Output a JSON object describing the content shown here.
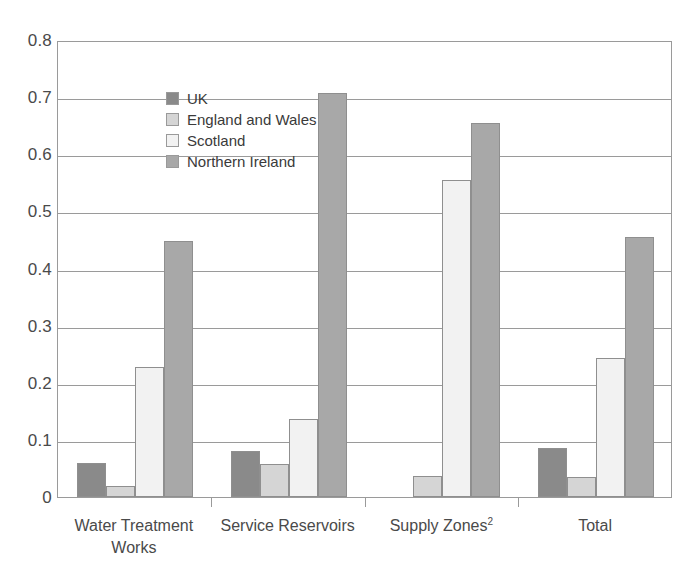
{
  "chart_data": {
    "type": "bar",
    "title": "",
    "xlabel": "",
    "ylabel": "",
    "ylim": [
      0,
      0.8
    ],
    "ytick_labels": [
      "0.8",
      "0.7",
      "0.6",
      "0.5",
      "0.4",
      "0.3",
      "0.2",
      "0.1",
      "0"
    ],
    "ytick_values": [
      0.8,
      0.7,
      0.6,
      0.5,
      0.4,
      0.3,
      0.2,
      0.1,
      0
    ],
    "grid": true,
    "legend_position": "top-left inside plot",
    "categories": [
      "Water Treatment Works",
      "Service Reservoirs",
      "Supply Zones",
      "Total"
    ],
    "category_footnotes": [
      "",
      "",
      "2",
      ""
    ],
    "series": [
      {
        "name": "UK",
        "color": "#8a8a8a",
        "values": [
          0.059,
          0.08,
          null,
          0.085
        ]
      },
      {
        "name": "England and Wales",
        "color": "#d5d5d5",
        "values": [
          0.02,
          0.058,
          0.037,
          0.035
        ]
      },
      {
        "name": "Scotland",
        "color": "#f2f2f2",
        "values": [
          0.227,
          0.137,
          0.555,
          0.244
        ]
      },
      {
        "name": "Northern Ireland",
        "color": "#a8a8a8",
        "values": [
          0.449,
          0.707,
          0.655,
          0.456
        ]
      }
    ]
  },
  "legend": {
    "items": [
      {
        "label": "UK",
        "swatch_name": "legend-swatch-uk"
      },
      {
        "label": "England and Wales",
        "swatch_name": "legend-swatch-england-and-wales"
      },
      {
        "label": "Scotland",
        "swatch_name": "legend-swatch-scotland"
      },
      {
        "label": "Northern Ireland",
        "swatch_name": "legend-swatch-northern-ireland"
      }
    ]
  },
  "axis_labels": {
    "x": [
      "Water Treatment Works",
      "Service Reservoirs",
      "Supply Zones",
      "Total"
    ]
  },
  "colors": {
    "uk": "#8a8a8a",
    "england_and_wales": "#d5d5d5",
    "scotland": "#f2f2f2",
    "northern_ireland": "#a8a8a8",
    "axis": "#9a9a9a",
    "text": "#3a3a3a",
    "background": "#ffffff"
  }
}
